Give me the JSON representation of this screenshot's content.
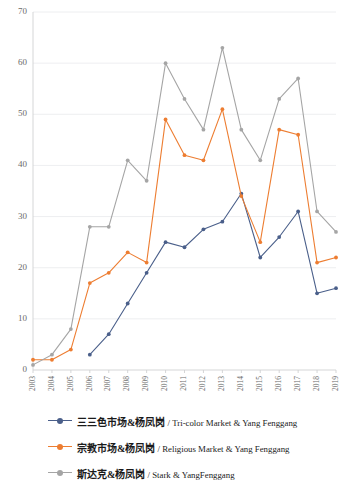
{
  "chart_data": {
    "type": "line",
    "title": "",
    "subtitle": "",
    "xlabel": "",
    "ylabel": "",
    "ylim": [
      0,
      70
    ],
    "yticks": [
      0,
      10,
      20,
      30,
      40,
      50,
      60,
      70
    ],
    "ytick_labels": [
      "0",
      "10",
      "20",
      "30",
      "40",
      "50",
      "60",
      "70"
    ],
    "grid": true,
    "legend_position": "bottom-left",
    "categories": [
      "2003",
      "2004",
      "2005",
      "2006",
      "2007",
      "2008",
      "2009",
      "2010",
      "2011",
      "2012",
      "2013",
      "2014",
      "2015",
      "2016",
      "2017",
      "2018",
      "2019"
    ],
    "x": [
      "2003",
      "2004",
      "2005",
      "2006",
      "2007",
      "2008",
      "2009",
      "2010",
      "2011",
      "2012",
      "2013",
      "2014",
      "2015",
      "2016",
      "2017",
      "2018",
      "2019"
    ],
    "series": [
      {
        "name": "三三色市场&杨凤岗 / Tri-color Market & Yang Fenggang",
        "name_cn": "三三色市场&杨凤岗",
        "name_en": "Tri-color Market & Yang Fenggang",
        "color": "#4a5f8a",
        "values": [
          null,
          null,
          null,
          3,
          7,
          13,
          19,
          25,
          24,
          27.5,
          29,
          34.5,
          22,
          26,
          31,
          15,
          16
        ]
      },
      {
        "name": "宗教市场&杨凤岗 / Religious Market & Yang Fenggang",
        "name_cn": "宗教市场&杨凤岗",
        "name_en": "Religious Market & Yang Fenggang",
        "color": "#ed7d31",
        "values": [
          2,
          2,
          4,
          17,
          19,
          23,
          21,
          49,
          42,
          41,
          51,
          34,
          25,
          47,
          46,
          21,
          22
        ]
      },
      {
        "name": "斯达克&杨凤岗 / Stark & YangFenggang",
        "name_cn": "斯达克&杨凤岗",
        "name_en": "Stark & YangFenggang",
        "color": "#a5a5a5",
        "values": [
          1,
          3,
          8,
          28,
          28,
          41,
          37,
          60,
          53,
          47,
          63,
          47,
          41,
          53,
          57,
          31,
          27
        ]
      }
    ]
  },
  "legend": {
    "items": [
      {
        "cn": "三三色市场&杨凤岗",
        "sep": " / ",
        "en": "Tri-color Market & Yang Fenggang",
        "color": "#4a5f8a"
      },
      {
        "cn": "宗教市场&杨凤岗",
        "sep": " / ",
        "en": "Religious Market & Yang Fenggang",
        "color": "#ed7d31"
      },
      {
        "cn": "斯达克&杨凤岗",
        "sep": " / ",
        "en": "Stark & YangFenggang",
        "color": "#a5a5a5"
      }
    ]
  }
}
